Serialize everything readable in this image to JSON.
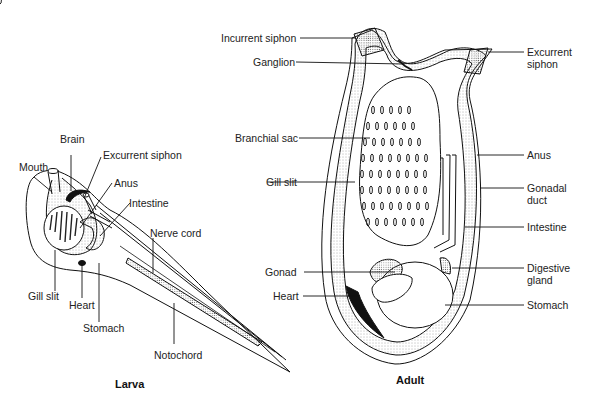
{
  "figure": {
    "larva": {
      "title": "Larva",
      "labels": {
        "mouth": "Mouth",
        "brain": "Brain",
        "excurrent_siphon": "Excurrent siphon",
        "anus": "Anus",
        "intestine": "Intestine",
        "nerve_cord": "Nerve cord",
        "gill_slit": "Gill slit",
        "heart": "Heart",
        "stomach": "Stomach",
        "notochord": "Notochord"
      }
    },
    "adult": {
      "title": "Adult",
      "labels": {
        "incurrent_siphon": "Incurrent siphon",
        "ganglion": "Ganglion",
        "branchial_sac": "Branchial sac",
        "gill_slit": "Gill slit",
        "gonad": "Gonad",
        "heart": "Heart",
        "excurrent_siphon_1": "Excurrent",
        "excurrent_siphon_2": "siphon",
        "anus": "Anus",
        "gonadal_duct_1": "Gonadal",
        "gonadal_duct_2": "duct",
        "intestine": "Intestine",
        "digestive_gland_1": "Digestive",
        "digestive_gland_2": "gland",
        "stomach": "Stomach"
      }
    }
  }
}
